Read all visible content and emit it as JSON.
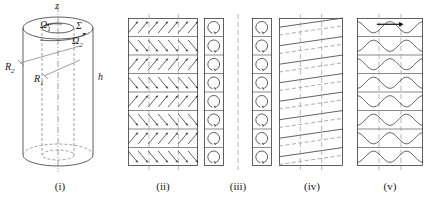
{
  "figure": {
    "kind": "scientific-diagram",
    "background_color": "#ffffff",
    "line_color": "#3a3a3a",
    "accent_color": "#555555",
    "width": 442,
    "height": 205
  },
  "panels": [
    {
      "id": "i",
      "caption": "(i)",
      "type": "cylinder-geometry",
      "caption_x": 58,
      "caption_y": 185,
      "labels": [
        {
          "name": "axis-label-z",
          "text": "z",
          "sub": "",
          "x": 55,
          "y": 3,
          "italic": true
        },
        {
          "name": "omega-1-label",
          "text": "Ω",
          "sub": "1",
          "x": 42,
          "y": 25,
          "italic": true
        },
        {
          "name": "sigma-label",
          "text": "Σ",
          "sub": "",
          "x": 76,
          "y": 26,
          "italic": true
        },
        {
          "name": "omega-2-label",
          "text": "Ω",
          "sub": "2",
          "x": 73,
          "y": 41,
          "italic": true
        },
        {
          "name": "radius-2-label",
          "text": "R",
          "sub": "2",
          "x": 8,
          "y": 66,
          "italic": true
        },
        {
          "name": "radius-1-label",
          "text": "R",
          "sub": "1",
          "x": 36,
          "y": 76,
          "italic": true
        },
        {
          "name": "height-label-h",
          "text": "h",
          "sub": "",
          "x": 98,
          "y": 78,
          "italic": true
        }
      ]
    },
    {
      "id": "ii",
      "caption": "(ii)",
      "type": "arrow-grid",
      "caption_x": 160,
      "caption_y": 185,
      "rows": 8,
      "arrows_per_row": 7,
      "row_directions": [
        "up",
        "down",
        "up",
        "down",
        "up",
        "down",
        "up",
        "down"
      ],
      "center_dashed_line": true
    },
    {
      "id": "iii",
      "caption": "(iii)",
      "type": "vortex-columns",
      "caption_x": 238,
      "caption_y": 185,
      "columns": 2,
      "cells_per_column": 8,
      "cell_glyph": "circular-arrow",
      "center_dashed_line": true
    },
    {
      "id": "iv",
      "caption": "(iv)",
      "type": "tilted-bands",
      "caption_x": 312,
      "caption_y": 185,
      "bands": 8,
      "solid_tilt": true,
      "dashed_horizontals": true,
      "vertical_dashed_lines": 2
    },
    {
      "id": "v",
      "caption": "(v)",
      "type": "wavy-bands",
      "caption_x": 389,
      "caption_y": 185,
      "bands": 8,
      "wave_periods": 2,
      "drift_arrow": true,
      "vertical_dashed_lines": 2
    }
  ]
}
